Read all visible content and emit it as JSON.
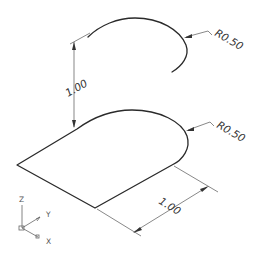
{
  "drawing": {
    "type": "isometric CAD drawing",
    "top_arc": {
      "radius_label": "R0.50"
    },
    "bottom_face": {
      "radius_label": "R0.50"
    },
    "dimensions": {
      "vertical_height_label": "1.00",
      "bottom_length_label": "1.00"
    },
    "ucs_icon": {
      "z_label": "Z",
      "y_label": "Y",
      "x_label": "X"
    }
  },
  "colors": {
    "geometry": "#2a2a2a",
    "dimension": "#555555",
    "background": "#ffffff"
  }
}
